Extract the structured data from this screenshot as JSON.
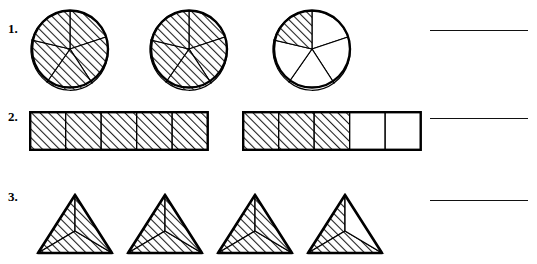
{
  "worksheet": {
    "background_color": "#ffffff",
    "ink_color": "#000000",
    "hatch_color": "#1a1a1a"
  },
  "rows": [
    {
      "number_label": "1.",
      "shape_type": "circle",
      "figures": [
        {
          "name": "circle-1",
          "total_parts": 5,
          "shaded_parts": 5,
          "shaded_indices": [
            0,
            1,
            2,
            3,
            4
          ]
        },
        {
          "name": "circle-2",
          "total_parts": 5,
          "shaded_parts": 5,
          "shaded_indices": [
            0,
            1,
            2,
            3,
            4
          ]
        },
        {
          "name": "circle-3",
          "total_parts": 5,
          "shaded_parts": 1,
          "shaded_indices": [
            4
          ]
        }
      ],
      "answer_line": ""
    },
    {
      "number_label": "2.",
      "shape_type": "bar",
      "figures": [
        {
          "name": "bar-1",
          "total_parts": 5,
          "shaded_parts": 5,
          "shaded_indices": [
            0,
            1,
            2,
            3,
            4
          ]
        },
        {
          "name": "bar-2",
          "total_parts": 5,
          "shaded_parts": 3,
          "shaded_indices": [
            0,
            1,
            2
          ]
        }
      ],
      "answer_line": ""
    },
    {
      "number_label": "3.",
      "shape_type": "triangle",
      "figures": [
        {
          "name": "triangle-1",
          "total_parts": 3,
          "shaded_parts": 3,
          "shaded_indices": [
            0,
            1,
            2
          ]
        },
        {
          "name": "triangle-2",
          "total_parts": 3,
          "shaded_parts": 3,
          "shaded_indices": [
            0,
            1,
            2
          ]
        },
        {
          "name": "triangle-3",
          "total_parts": 3,
          "shaded_parts": 3,
          "shaded_indices": [
            0,
            1,
            2
          ]
        },
        {
          "name": "triangle-4",
          "total_parts": 3,
          "shaded_parts": 2,
          "shaded_indices": [
            0,
            2
          ]
        }
      ],
      "answer_line": ""
    }
  ]
}
